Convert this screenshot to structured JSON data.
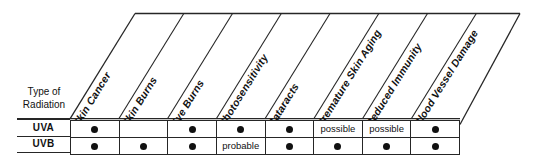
{
  "chart_data": {
    "type": "table",
    "title": "",
    "row_header_label": "Type of Radiation",
    "row_header_line1": "Type of",
    "row_header_line2": "Radiation",
    "columns": [
      "Skin Cancer",
      "Skin Burns",
      "Eye Burns",
      "Photosensitivity",
      "Cataracts",
      "Premature Skin Aging",
      "Reduced Immunity",
      "Blood Vessel Damage"
    ],
    "rows": [
      {
        "label": "UVA",
        "values": [
          "dot",
          "",
          "dot",
          "dot",
          "dot",
          "possible",
          "possible",
          "dot"
        ]
      },
      {
        "label": "UVB",
        "values": [
          "dot",
          "dot",
          "dot",
          "probable",
          "dot",
          "dot",
          "dot",
          "dot"
        ]
      }
    ],
    "legend": {
      "dot_meaning": "●",
      "text_values": [
        "possible",
        "probable"
      ]
    },
    "xlabel": "",
    "ylabel": "",
    "grid": true,
    "colors": {
      "line": "#262626",
      "text": "#111111",
      "marker": "#111111",
      "background": "#ffffff"
    }
  }
}
